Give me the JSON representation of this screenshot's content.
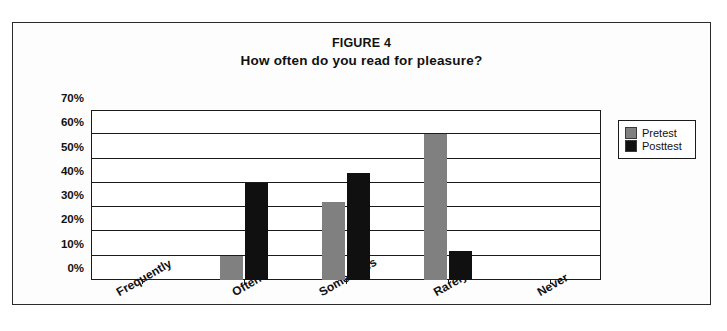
{
  "chart_data": {
    "type": "bar",
    "title": "FIGURE 4",
    "subtitle": "How often do you read for pleasure?",
    "xlabel": "",
    "ylabel": "",
    "ylim": [
      0,
      70
    ],
    "ytick_values": [
      70,
      60,
      50,
      40,
      30,
      20,
      10,
      0
    ],
    "ytick_labels": [
      "70%",
      "60%",
      "50%",
      "40%",
      "30%",
      "20%",
      "10%",
      "0%"
    ],
    "grid": true,
    "legend_position": "right",
    "categories": [
      "Frequently",
      "Often",
      "Sometimes",
      "Rarely",
      "Never"
    ],
    "series": [
      {
        "name": "Pretest",
        "color": "#808080",
        "values": [
          0,
          10,
          32,
          60,
          0
        ]
      },
      {
        "name": "Posttest",
        "color": "#101010",
        "values": [
          0,
          40,
          44,
          12,
          0
        ]
      }
    ]
  },
  "legend": {
    "entries": [
      {
        "label": "Pretest"
      },
      {
        "label": "Posttest"
      }
    ]
  }
}
